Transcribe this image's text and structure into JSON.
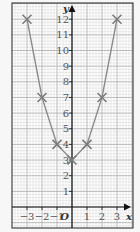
{
  "chart_data": {
    "type": "line",
    "title": "",
    "xlabel": "x",
    "ylabel": "y",
    "origin_label": "O",
    "x": [
      -3,
      -2,
      -1,
      0,
      1,
      2,
      3
    ],
    "series": [
      {
        "name": "y = x^2 + 3",
        "values": [
          12,
          7,
          4,
          3,
          4,
          7,
          12
        ],
        "marker": "cross"
      }
    ],
    "xlim": [
      -3.8,
      3.5
    ],
    "ylim": [
      -1.3,
      13.1
    ],
    "x_ticks": [
      -3,
      -2,
      -1,
      1,
      2,
      3
    ],
    "x_tick_labels": [
      "−3",
      "−2",
      "−1",
      "1",
      "2",
      "3"
    ],
    "y_ticks": [
      1,
      2,
      3,
      4,
      5,
      6,
      7,
      8,
      9,
      10,
      11,
      12
    ],
    "y_tick_labels": [
      "1",
      "2",
      "3",
      "4",
      "5",
      "6",
      "7",
      "8",
      "9",
      "10",
      "11",
      "12"
    ],
    "grid": true,
    "colors": {
      "background": "#f7f7f7",
      "paper": "#ffffff",
      "fine_grid": "#d4d4d4",
      "major_grid": "#a9a9a9",
      "frame": "#444444",
      "axis": "#111111",
      "line": "#8a8a8a",
      "marker": "#7a7a7a"
    }
  }
}
